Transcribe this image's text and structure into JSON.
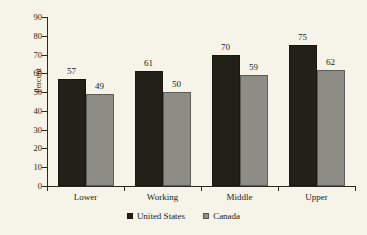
{
  "chart_data": {
    "type": "bar",
    "title": "",
    "subtitle": "",
    "xlabel": "",
    "ylabel": "Percent",
    "ylim": [
      0,
      90
    ],
    "ytick_step": 10,
    "yticks": [
      0,
      10,
      20,
      30,
      40,
      50,
      60,
      70,
      80,
      90
    ],
    "ytick_labels": [
      "0",
      "10",
      "20",
      "30",
      "40",
      "50",
      "60",
      "70",
      "80",
      "90"
    ],
    "grid": false,
    "legend_position": "bottom-center",
    "categories": [
      "Lower",
      "Working",
      "Middle",
      "Upper"
    ],
    "series": [
      {
        "name": "United States",
        "color": "#232018",
        "values": [
          57,
          61,
          70,
          75
        ],
        "data_labels": [
          "57",
          "61",
          "70",
          "75"
        ]
      },
      {
        "name": "Canada",
        "color": "#8d8d86",
        "values": [
          49,
          50,
          59,
          62
        ],
        "data_labels": [
          "49",
          "50",
          "59",
          "62"
        ]
      }
    ]
  },
  "chart": {
    "y_axis_title": "Percent",
    "background_color": "#f6f4e9",
    "axis_color": "#2b2822",
    "text_color": "#201d16"
  },
  "legend": {
    "items": [
      {
        "label": "United States",
        "swatch": "black-square-marker"
      },
      {
        "label": "Canada",
        "swatch": "gray-square-marker"
      }
    ]
  }
}
